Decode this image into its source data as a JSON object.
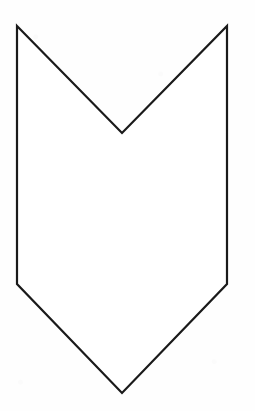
{
  "document": {
    "kind": "line-drawing",
    "background_color": "#fefefe",
    "width": 255,
    "height": 411,
    "caption": "",
    "title": ""
  },
  "figure": {
    "name": "chevron-banner-outline",
    "stroke_color": "#1a1a1a",
    "fill_color": "#ffffff",
    "stroke_width": 2.2,
    "closed": true,
    "vertex_count": 7,
    "vertices": [
      {
        "label": "top-left-peak",
        "x": 17,
        "y": 26
      },
      {
        "label": "center-notch-bottom",
        "x": 122,
        "y": 133
      },
      {
        "label": "top-right-peak",
        "x": 227,
        "y": 26
      },
      {
        "label": "right-shoulder",
        "x": 227,
        "y": 284
      },
      {
        "label": "bottom-point",
        "x": 122,
        "y": 393
      },
      {
        "label": "left-shoulder",
        "x": 17,
        "y": 284
      },
      {
        "label": "left-top-return",
        "x": 17,
        "y": 26
      }
    ],
    "path": "M 17,26 L 122,133 L 227,26 L 227,284 L 122,393 L 17,284 Z"
  }
}
